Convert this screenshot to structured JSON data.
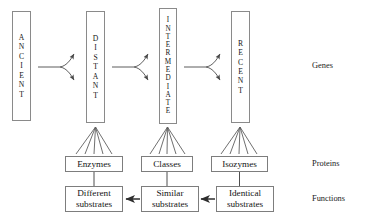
{
  "diagram": {
    "genes": [
      {
        "id": "ancient",
        "label": "ANCIENT",
        "letters": [
          "A",
          "N",
          "C",
          "I",
          "E",
          "N",
          "T"
        ]
      },
      {
        "id": "distant",
        "label": "DISTANT",
        "letters": [
          "D",
          "I",
          "S",
          "T",
          "A",
          "N",
          "T"
        ]
      },
      {
        "id": "intermediate",
        "label": "INTERMEDIATE",
        "letters": [
          "I",
          "N",
          "T",
          "E",
          "R",
          "M",
          "E",
          "D",
          "I",
          "A",
          "T",
          "E"
        ]
      },
      {
        "id": "recent",
        "label": "RECENT",
        "letters": [
          "R",
          "E",
          "C",
          "E",
          "N",
          "T"
        ]
      }
    ],
    "proteins": [
      {
        "id": "enzymes",
        "label": "Enzymes"
      },
      {
        "id": "classes",
        "label": "Classes"
      },
      {
        "id": "isozymes",
        "label": "Isozymes"
      }
    ],
    "functions": [
      {
        "id": "different-substrates",
        "line1": "Different",
        "line2": "substrates"
      },
      {
        "id": "similar-substrates",
        "line1": "Similar",
        "line2": "substrates"
      },
      {
        "id": "identical-substrates",
        "line1": "Identical",
        "line2": "substrates"
      }
    ],
    "row_labels": [
      {
        "id": "genes",
        "label": "Genes"
      },
      {
        "id": "proteins",
        "label": "Proteins"
      },
      {
        "id": "functions",
        "label": "Functions"
      }
    ],
    "colors": {
      "stroke": "#6f6f6f",
      "box_border": "#8a8a8a",
      "text": "#161616",
      "background": "#ffffff"
    }
  }
}
